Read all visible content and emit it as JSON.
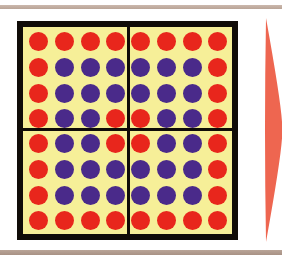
{
  "figure": {
    "board": {
      "rows": 8,
      "cols": 8,
      "quadrants": 4,
      "grid": [
        [
          "R",
          "R",
          "R",
          "R",
          "R",
          "R",
          "R",
          "R"
        ],
        [
          "R",
          "B",
          "B",
          "B",
          "B",
          "B",
          "B",
          "R"
        ],
        [
          "R",
          "B",
          "B",
          "B",
          "B",
          "B",
          "B",
          "R"
        ],
        [
          "R",
          "B",
          "B",
          "R",
          "R",
          "B",
          "B",
          "R"
        ],
        [
          "R",
          "B",
          "B",
          "R",
          "R",
          "B",
          "B",
          "R"
        ],
        [
          "R",
          "B",
          "B",
          "B",
          "B",
          "B",
          "B",
          "R"
        ],
        [
          "R",
          "B",
          "B",
          "B",
          "B",
          "B",
          "B",
          "R"
        ],
        [
          "R",
          "R",
          "R",
          "R",
          "R",
          "R",
          "R",
          "R"
        ]
      ],
      "counts": {
        "red": 32,
        "blue": 32
      }
    },
    "colors": {
      "board_fill": "#f6ef98",
      "border": "#100c08",
      "red_dot": "#e8261c",
      "blue_dot": "#4a2a8a",
      "wedge": "#ee6650",
      "frame_bar": "#bba699"
    }
  }
}
